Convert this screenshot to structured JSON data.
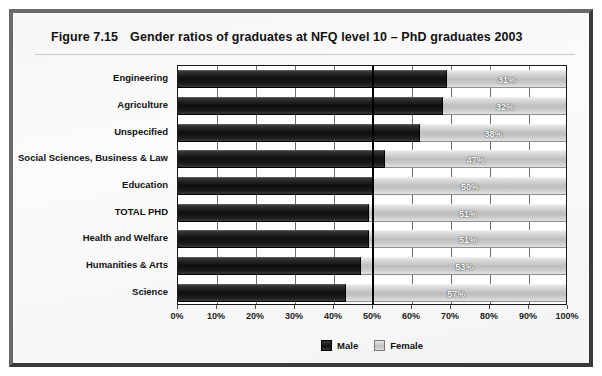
{
  "figure": {
    "number": "Figure 7.15",
    "title": "Gender ratios of graduates at NFQ level 10 – PhD graduates 2003"
  },
  "chart_data": {
    "type": "bar",
    "orientation": "horizontal",
    "stacked": true,
    "normalized_percent": true,
    "title": "Gender ratios of graduates at NFQ level 10 – PhD graduates 2003",
    "xlabel": "",
    "ylabel": "",
    "xlim": [
      0,
      100
    ],
    "xticks": [
      0,
      10,
      20,
      30,
      40,
      50,
      60,
      70,
      80,
      90,
      100
    ],
    "xtick_labels": [
      "0%",
      "10%",
      "20%",
      "30%",
      "40%",
      "50%",
      "60%",
      "70%",
      "80%",
      "90%",
      "100%"
    ],
    "grid": true,
    "emphasized_gridline": 50,
    "legend_position": "bottom-center",
    "categories": [
      "Engineering",
      "Agriculture",
      "Unspecified",
      "Social Sciences, Business & Law",
      "Education",
      "TOTAL PHD",
      "Health and Welfare",
      "Humanities & Arts",
      "Science"
    ],
    "series": [
      {
        "name": "Male",
        "color": "#101010",
        "values": [
          69,
          68,
          62,
          53,
          50,
          49,
          49,
          47,
          43
        ],
        "labels_shown": false
      },
      {
        "name": "Female",
        "color": "#c2c2c2",
        "values": [
          31,
          32,
          38,
          47,
          50,
          51,
          51,
          53,
          57
        ],
        "labels_shown": true,
        "value_labels": [
          "31%",
          "32%",
          "38%",
          "47%",
          "50%",
          "51%",
          "51%",
          "53%",
          "57%"
        ]
      }
    ]
  },
  "legend": {
    "items": [
      {
        "label": "Male",
        "swatch": "male"
      },
      {
        "label": "Female",
        "swatch": "female"
      }
    ]
  },
  "colors": {
    "frame": "#4a4a4a",
    "panel": "#f7f7f7",
    "male": "#101010",
    "female": "#c2c2c2",
    "axis": "#1a1a1a"
  }
}
